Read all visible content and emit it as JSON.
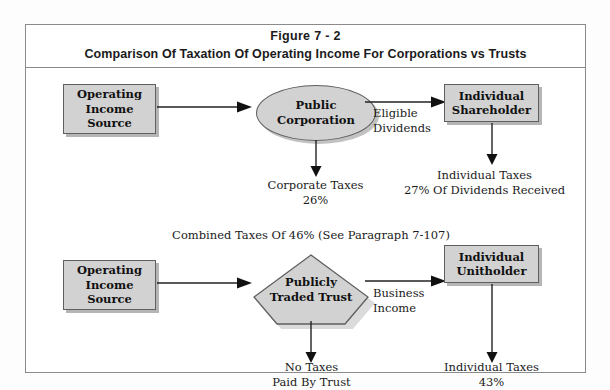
{
  "figure": {
    "title_line1": "Figure 7 - 2",
    "title_line2": "Comparison Of Taxation Of Operating Income For Corporations vs Trusts",
    "accent_fill": "#d2d2d2",
    "accent_stroke": "#5f5f5f",
    "frame_stroke": "#8a8a8a",
    "text_color": "#1b1b1b"
  },
  "corporate_flow": {
    "source_box": {
      "line1": "Operating",
      "line2": "Income",
      "line3": "Source"
    },
    "entity_ellipse": {
      "line1": "Public",
      "line2": "Corporation"
    },
    "transfer_label": {
      "line1": "Eligible",
      "line2": "Dividends"
    },
    "recipient_box": {
      "line1": "Individual",
      "line2": "Shareholder"
    },
    "entity_tax": {
      "line1": "Corporate Taxes",
      "line2": "26%"
    },
    "recipient_tax": {
      "line1": "Individual Taxes",
      "line2": "27% Of Dividends Received"
    }
  },
  "combined_note": "Combined Taxes Of 46% (See Paragraph 7-107)",
  "trust_flow": {
    "source_box": {
      "line1": "Operating",
      "line2": "Income",
      "line3": "Source"
    },
    "entity_pentagon": {
      "line1": "Publicly",
      "line2": "Traded Trust"
    },
    "transfer_label": {
      "line1": "Business",
      "line2": "Income"
    },
    "recipient_box": {
      "line1": "Individual",
      "line2": "Unitholder"
    },
    "entity_tax": {
      "line1": "No Taxes",
      "line2": "Paid By Trust"
    },
    "recipient_tax": {
      "line1": "Individual Taxes",
      "line2": "43%"
    }
  }
}
